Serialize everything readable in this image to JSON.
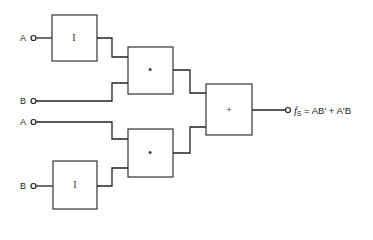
{
  "diagram": {
    "type": "logic-circuit",
    "inputs": [
      {
        "id": "A1",
        "label": "A",
        "to": "inv1"
      },
      {
        "id": "B1",
        "label": "B",
        "to": "and1"
      },
      {
        "id": "A2",
        "label": "A",
        "to": "and2"
      },
      {
        "id": "B2",
        "label": "B",
        "to": "inv2"
      }
    ],
    "gates": [
      {
        "id": "inv1",
        "symbol": "I",
        "kind": "inverter"
      },
      {
        "id": "and1",
        "symbol": "•",
        "kind": "and"
      },
      {
        "id": "or1",
        "symbol": "+",
        "kind": "or"
      },
      {
        "id": "and2",
        "symbol": "•",
        "kind": "and"
      },
      {
        "id": "inv2",
        "symbol": "I",
        "kind": "inverter"
      }
    ],
    "output": {
      "func": "f",
      "subscript": "S",
      "expression": "= AB' + A'B"
    }
  }
}
